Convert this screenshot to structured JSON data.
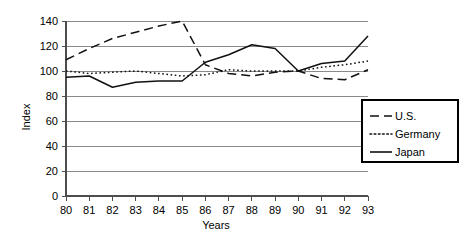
{
  "chart_data": {
    "type": "line",
    "title": "",
    "xlabel": "Years",
    "ylabel": "Index",
    "x": [
      "80",
      "81",
      "82",
      "83",
      "84",
      "85",
      "86",
      "87",
      "88",
      "89",
      "90",
      "91",
      "92",
      "93"
    ],
    "xlim": [
      80,
      93
    ],
    "ylim": [
      0,
      140
    ],
    "yticks": [
      0,
      20,
      40,
      60,
      80,
      100,
      120,
      140
    ],
    "grid": true,
    "legend_position": "right",
    "series": [
      {
        "name": "U.S.",
        "style": "dashed",
        "values": [
          109,
          118,
          126,
          131,
          136,
          140,
          105,
          98,
          96,
          99,
          100,
          94,
          93,
          101
        ]
      },
      {
        "name": "Germany",
        "style": "dotted",
        "values": [
          100,
          98,
          99,
          100,
          98,
          96,
          97,
          101,
          100,
          100,
          100,
          103,
          105,
          108
        ]
      },
      {
        "name": "Japan",
        "style": "solid",
        "values": [
          95,
          96,
          87,
          91,
          92,
          92,
          107,
          113,
          121,
          118,
          100,
          106,
          108,
          128
        ]
      }
    ]
  },
  "axes": {
    "y_tick_labels": [
      "140",
      "120",
      "100",
      "80",
      "60",
      "40",
      "20",
      "0"
    ],
    "x_tick_labels": [
      "80",
      "81",
      "82",
      "83",
      "84",
      "85",
      "86",
      "87",
      "88",
      "89",
      "90",
      "91",
      "92",
      "93"
    ],
    "y_axis_title": "Index",
    "x_axis_title": "Years"
  },
  "legend": {
    "items": [
      {
        "label": "U.S.",
        "style": "dashed"
      },
      {
        "label": "Germany",
        "style": "dotted"
      },
      {
        "label": "Japan",
        "style": "solid"
      }
    ]
  }
}
